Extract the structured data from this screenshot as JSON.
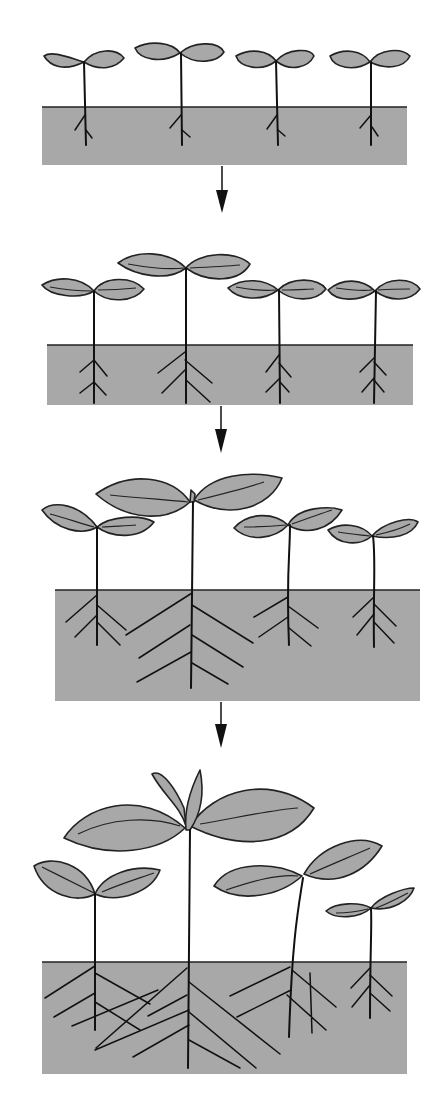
{
  "diagram": {
    "title": "",
    "colors": {
      "soil": "#a8a8a8",
      "leaf": "#a8a8a8",
      "outline": "#222222",
      "background": "#ffffff"
    },
    "stages": [
      {
        "index": 1,
        "plants": 4,
        "soil": {
          "x": 42,
          "y": 107,
          "w": 365,
          "h": 58
        }
      },
      {
        "index": 2,
        "plants": 4,
        "soil": {
          "x": 47,
          "y": 345,
          "w": 366,
          "h": 60
        }
      },
      {
        "index": 3,
        "plants": 4,
        "soil": {
          "x": 55,
          "y": 590,
          "w": 365,
          "h": 111
        }
      },
      {
        "index": 4,
        "plants": 4,
        "soil": {
          "x": 42,
          "y": 962,
          "w": 365,
          "h": 112
        }
      }
    ],
    "arrows": [
      {
        "from_stage": 1,
        "to_stage": 2
      },
      {
        "from_stage": 2,
        "to_stage": 3
      },
      {
        "from_stage": 3,
        "to_stage": 4
      }
    ]
  }
}
